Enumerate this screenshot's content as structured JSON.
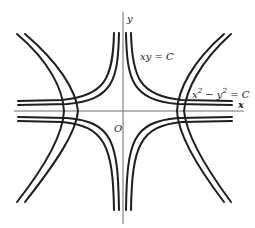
{
  "diagram": {
    "type": "orthogonal-hyperbola-families",
    "axes": {
      "x_label": "x",
      "y_label": "y",
      "origin_label": "O"
    },
    "families": [
      {
        "name": "xy-family",
        "label_main": "xy = C",
        "equation": "xy = C",
        "curves_per_quadrant": 2,
        "orientation": "asymptotic to coordinate axes"
      },
      {
        "name": "x2-y2-family",
        "label_parts": [
          "x",
          "2",
          " − y",
          "2",
          " = C"
        ],
        "equation": "x^2 - y^2 = C",
        "curves_per_side": 2,
        "orientation": "asymptotic to diagonals"
      }
    ],
    "colors": {
      "curve": "#1e1e1e",
      "axis": "#6a6a6a",
      "text": "#222222",
      "background": "#ffffff"
    }
  }
}
